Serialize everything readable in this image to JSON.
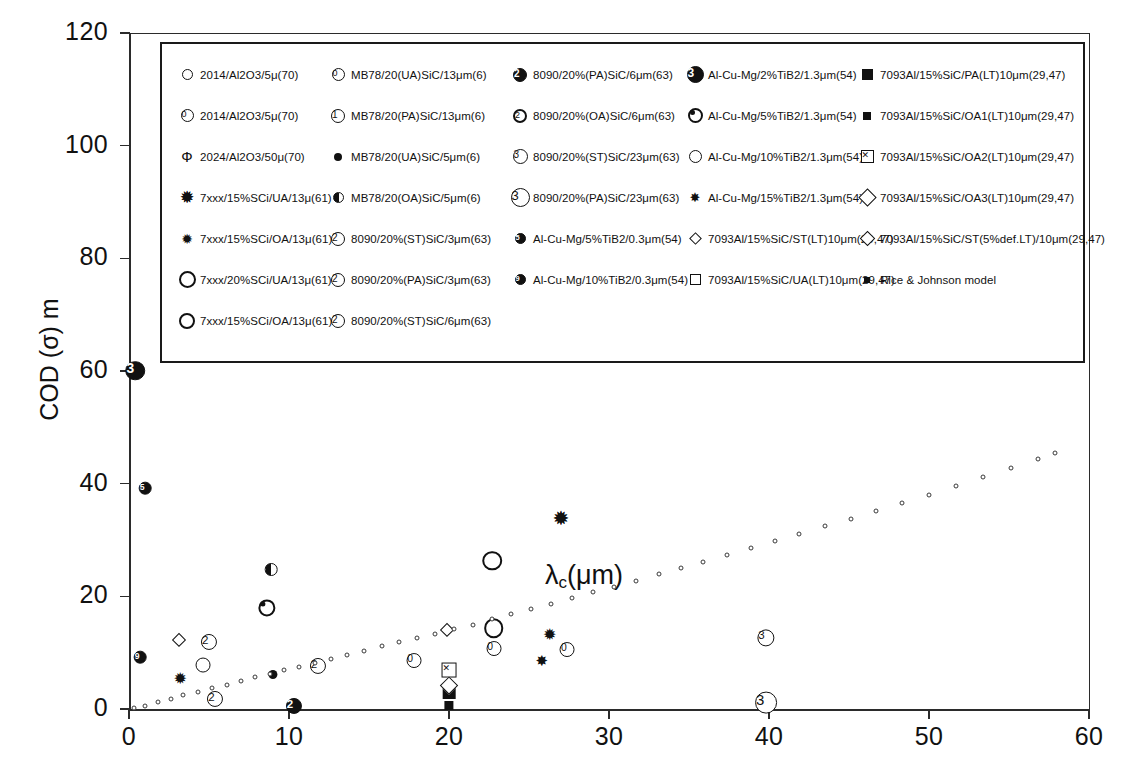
{
  "chart_data": {
    "type": "scatter",
    "title": "",
    "xlabel": "",
    "ylabel": "COD (σ) m",
    "annotation": "λᴄ(μm)",
    "xlim": [
      0,
      60
    ],
    "ylim": [
      0,
      120
    ],
    "xticks": [
      "0",
      "10",
      "20",
      "30",
      "40",
      "50",
      "60"
    ],
    "yticks": [
      "0",
      "20",
      "40",
      "60",
      "80",
      "100",
      "120"
    ],
    "grid": false,
    "legend_position": "top-inside",
    "series": [
      {
        "name": "2014/Al2O3/5μ(70)",
        "marker": "open-circle-sm",
        "points": []
      },
      {
        "name": "2014/Al2O3/5μ(70)",
        "marker": "circ-num-0",
        "points": [
          [
            17.8,
            9.0
          ],
          [
            22.8,
            11.2
          ],
          [
            27.4,
            11.0
          ]
        ]
      },
      {
        "name": "2024/Al2O3/50μ(70)",
        "marker": "phi",
        "points": []
      },
      {
        "name": "7xxx/15%SCi/UA/13μ(61)",
        "marker": "star-open",
        "points": [
          [
            27.0,
            33.8
          ]
        ]
      },
      {
        "name": "7xxx/15%SCi/OA/13μ(61)",
        "marker": "star-fill",
        "points": [
          [
            3.2,
            5.4
          ],
          [
            26.3,
            13.2
          ]
        ]
      },
      {
        "name": "7xxx/20%SCi/UA/13μ(61)",
        "marker": "open-circle-lg",
        "points": [
          [
            22.7,
            26.0
          ],
          [
            22.8,
            14.0
          ]
        ]
      },
      {
        "name": "7xxx/15%SCi/OA/13μ(61)",
        "marker": "open-circle-lg2",
        "points": []
      },
      {
        "name": "MB78/20(UA)SiC/13μm(6)",
        "marker": "circ-num-0b",
        "points": []
      },
      {
        "name": "MB78/20(PA)SiC/13μm(6)",
        "marker": "circ-num-1",
        "points": []
      },
      {
        "name": "MB78/20(UA)SiC/5μm(6)",
        "marker": "circ-dot-fill",
        "points": [
          [
            9.0,
            6.2
          ]
        ]
      },
      {
        "name": "MB78/20(OA)SiC/5μm(6)",
        "marker": "circ-half",
        "points": [
          [
            8.9,
            24.5
          ]
        ]
      },
      {
        "name": "8090/20%(ST)SiC/3μm(63)",
        "marker": "circ-num-2",
        "points": [
          [
            5.0,
            12.3
          ]
        ]
      },
      {
        "name": "8090/20%(PA)SiC/3μm(63)",
        "marker": "circ-num-2b",
        "points": [
          [
            5.4,
            2.2
          ]
        ]
      },
      {
        "name": "8090/20%(ST)SiC/6μm(63)",
        "marker": "circ-num-2c",
        "points": [
          [
            11.8,
            8.0
          ]
        ]
      },
      {
        "name": "8090/20%(PA)SiC/6μm(63)",
        "marker": "circ-num-2-fill",
        "points": [
          [
            10.3,
            0.9
          ]
        ]
      },
      {
        "name": "8090/20%(OA)SiC/6μm(63)",
        "marker": "circ-num-2-ring",
        "points": []
      },
      {
        "name": "8090/20%(ST)SiC/23μm(63)",
        "marker": "circ-num-3",
        "points": [
          [
            39.8,
            13.0
          ]
        ]
      },
      {
        "name": "8090/20%(PA)SiC/23μm(63)",
        "marker": "circ-num-3-lg",
        "points": [
          [
            39.8,
            1.2
          ]
        ]
      },
      {
        "name": "Al-Cu-Mg/5%TiB2/0.3μm(54)",
        "marker": "circ-small-fill-a",
        "points": [
          [
            1.0,
            39.7
          ]
        ]
      },
      {
        "name": "Al-Cu-Mg/10%TiB2/0.3μm(54)",
        "marker": "circ-small-fill-b",
        "points": [
          [
            0.7,
            9.7
          ]
        ]
      },
      {
        "name": "Al-Cu-Mg/2%TiB2/1.3μm(54)",
        "marker": "circ-num-3-fill",
        "points": [
          [
            0.4,
            60.2
          ]
        ]
      },
      {
        "name": "Al-Cu-Mg/5%TiB2/1.3μm(54)",
        "marker": "bullseye",
        "points": [
          [
            8.6,
            17.6
          ]
        ]
      },
      {
        "name": "Al-Cu-Mg/10%TiB2/1.3μm(54)",
        "marker": "ring-dot",
        "points": [
          [
            4.6,
            7.4
          ]
        ]
      },
      {
        "name": "Al-Cu-Mg/15%TiB2/1.3μm(54)",
        "marker": "star-fill-b",
        "points": [
          [
            25.8,
            8.6
          ]
        ]
      },
      {
        "name": "7093Al/15%SiC/ST(LT)10μm(29,47)",
        "marker": "diamond-sm",
        "points": [
          [
            3.1,
            12.2
          ],
          [
            19.9,
            14.0
          ]
        ]
      },
      {
        "name": "7093Al/15%SiC/UA(LT)10μm(29,47)",
        "marker": "square-open",
        "points": []
      },
      {
        "name": "7093Al/15%SiC/PA(LT)10μm(29,47)",
        "marker": "square-fill-lg",
        "points": [
          [
            20.0,
            2.7
          ]
        ]
      },
      {
        "name": "7093Al/15%SiC/OA1(LT)10μm(29,47)",
        "marker": "square-fill-sm",
        "points": [
          [
            20.0,
            0.7
          ]
        ]
      },
      {
        "name": "7093Al/15%SiC/OA2(LT)10μm(29,47)",
        "marker": "square-x",
        "points": [
          [
            20.0,
            7.5
          ]
        ]
      },
      {
        "name": "7093Al/15%SiC/OA3(LT)10μm(29,47)",
        "marker": "diamond-lg",
        "points": []
      },
      {
        "name": "7093Al/15%SiC/ST(5%def.LT)/10μm(29,47)",
        "marker": "diamond-md",
        "points": [
          [
            20.0,
            4.0
          ]
        ]
      },
      {
        "name": "Rice & Johnson model",
        "marker": "tiny-dot",
        "points": [
          [
            0.3,
            0.1
          ],
          [
            1.0,
            0.6
          ],
          [
            1.8,
            1.2
          ],
          [
            2.6,
            1.8
          ],
          [
            3.4,
            2.4
          ],
          [
            4.3,
            3.0
          ],
          [
            5.2,
            3.7
          ],
          [
            6.1,
            4.3
          ],
          [
            7.0,
            5.0
          ],
          [
            7.9,
            5.6
          ],
          [
            8.8,
            6.2
          ],
          [
            9.7,
            6.9
          ],
          [
            10.6,
            7.5
          ],
          [
            11.6,
            8.2
          ],
          [
            12.6,
            8.9
          ],
          [
            13.6,
            9.6
          ],
          [
            14.7,
            10.3
          ],
          [
            15.8,
            11.1
          ],
          [
            16.9,
            11.9
          ],
          [
            18.0,
            12.6
          ],
          [
            19.1,
            13.4
          ],
          [
            20.3,
            14.2
          ],
          [
            21.5,
            15.0
          ],
          [
            22.7,
            15.9
          ],
          [
            23.9,
            16.8
          ],
          [
            25.1,
            17.7
          ],
          [
            26.4,
            18.7
          ],
          [
            27.7,
            19.7
          ],
          [
            29.0,
            20.7
          ],
          [
            30.3,
            21.7
          ],
          [
            31.7,
            22.8
          ],
          [
            33.1,
            23.9
          ],
          [
            34.5,
            25.0
          ],
          [
            35.9,
            26.1
          ],
          [
            37.4,
            27.3
          ],
          [
            38.9,
            28.5
          ],
          [
            40.4,
            29.8
          ],
          [
            41.9,
            31.0
          ],
          [
            43.5,
            32.4
          ],
          [
            45.1,
            33.7
          ],
          [
            46.7,
            35.1
          ],
          [
            48.3,
            36.5
          ],
          [
            50.0,
            38.0
          ],
          [
            51.7,
            39.5
          ],
          [
            53.4,
            41.1
          ],
          [
            55.1,
            42.7
          ],
          [
            56.8,
            44.4
          ],
          [
            57.9,
            45.5
          ]
        ]
      }
    ]
  },
  "axes": {
    "y_title": "COD (σ) m",
    "x_ticks": [
      "0",
      "10",
      "20",
      "30",
      "40",
      "50",
      "60"
    ],
    "y_ticks": [
      "120",
      "100",
      "80",
      "60",
      "40",
      "20",
      "0"
    ],
    "annotation_main": "λ",
    "annotation_sub": "c",
    "annotation_tail": "(μm)"
  },
  "legend": {
    "columns": [
      {
        "entries": [
          {
            "symbol": "open-circle-sm",
            "label": "2014/Al2O3/5μ(70)"
          },
          {
            "symbol": "circ-num-0",
            "label": "2014/Al2O3/5μ(70)"
          },
          {
            "symbol": "phi",
            "label": "2024/Al2O3/50μ(70)"
          },
          {
            "symbol": "star-open",
            "label": "7xxx/15%SCi/UA/13μ(61)"
          },
          {
            "symbol": "star-fill",
            "label": "7xxx/15%SCi/OA/13μ(61)"
          },
          {
            "symbol": "open-circle-lg",
            "label": "7xxx/20%SCi/UA/13μ(61)"
          },
          {
            "symbol": "open-circle-lg2",
            "label": "7xxx/15%SCi/OA/13μ(61)"
          }
        ]
      },
      {
        "entries": [
          {
            "symbol": "circ-num-0b",
            "label": "MB78/20(UA)SiC/13μm(6)"
          },
          {
            "symbol": "circ-num-1",
            "label": "MB78/20(PA)SiC/13μm(6)"
          },
          {
            "symbol": "circ-dot-fill",
            "label": "MB78/20(UA)SiC/5μm(6)"
          },
          {
            "symbol": "circ-half",
            "label": "MB78/20(OA)SiC/5μm(6)"
          },
          {
            "symbol": "circ-num-2",
            "label": "8090/20%(ST)SiC/3μm(63)"
          },
          {
            "symbol": "circ-num-2b",
            "label": "8090/20%(PA)SiC/3μm(63)"
          },
          {
            "symbol": "circ-num-2c",
            "label": "8090/20%(ST)SiC/6μm(63)"
          }
        ]
      },
      {
        "entries": [
          {
            "symbol": "circ-num-2-fill",
            "label": "8090/20%(PA)SiC/6μm(63)"
          },
          {
            "symbol": "circ-num-2-ring",
            "label": "8090/20%(OA)SiC/6μm(63)"
          },
          {
            "symbol": "circ-num-3",
            "label": "8090/20%(ST)SiC/23μm(63)"
          },
          {
            "symbol": "circ-num-3-lg",
            "label": "8090/20%(PA)SiC/23μm(63)"
          },
          {
            "symbol": "circ-small-fill-a",
            "label": "Al-Cu-Mg/5%TiB2/0.3μm(54)"
          },
          {
            "symbol": "circ-small-fill-b",
            "label": "Al-Cu-Mg/10%TiB2/0.3μm(54)"
          }
        ]
      },
      {
        "entries": [
          {
            "symbol": "circ-num-3-fill",
            "label": "Al-Cu-Mg/2%TiB2/1.3μm(54)"
          },
          {
            "symbol": "bullseye",
            "label": "Al-Cu-Mg/5%TiB2/1.3μm(54)"
          },
          {
            "symbol": "ring-dot",
            "label": "Al-Cu-Mg/10%TiB2/1.3μm(54)"
          },
          {
            "symbol": "star-fill-b",
            "label": "Al-Cu-Mg/15%TiB2/1.3μm(54)"
          },
          {
            "symbol": "diamond-sm",
            "label": "7093Al/15%SiC/ST(LT)10μm(29,47)"
          },
          {
            "symbol": "square-open",
            "label": "7093Al/15%SiC/UA(LT)10μm(29,47)"
          }
        ]
      },
      {
        "entries": [
          {
            "symbol": "square-fill-lg",
            "label": "7093Al/15%SiC/PA(LT)10μm(29,47)"
          },
          {
            "symbol": "square-fill-sm",
            "label": "7093Al/15%SiC/OA1(LT)10μm(29,47)"
          },
          {
            "symbol": "square-x",
            "label": "7093Al/15%SiC/OA2(LT)10μm(29,47)"
          },
          {
            "symbol": "diamond-lg",
            "label": "7093Al/15%SiC/OA3(LT)10μm(29,47)"
          },
          {
            "symbol": "diamond-md",
            "label": "7093Al/15%SiC/ST(5%def.LT)/10μm(29,47)"
          },
          {
            "symbol": "tiny-dot",
            "label": "Rice & Johnson model"
          }
        ]
      }
    ]
  },
  "colors": {
    "ink": "#111111",
    "axis": "#2b2b2b",
    "background": "#ffffff"
  }
}
